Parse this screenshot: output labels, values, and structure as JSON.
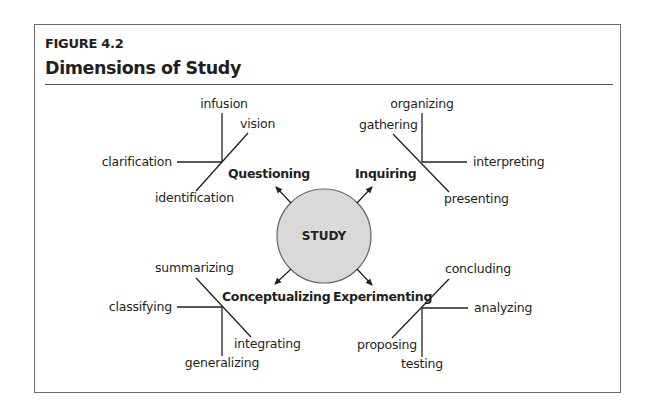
{
  "figure": {
    "label": "FIGURE 4.2",
    "title": "Dimensions of Study"
  },
  "center": {
    "label": "STUDY",
    "fill": "#d9d9d9",
    "stroke": "#666666"
  },
  "dimensions": [
    {
      "name": "Questioning",
      "position": "top-left",
      "branches": [
        "infusion",
        "vision",
        "clarification",
        "identification"
      ]
    },
    {
      "name": "Inquiring",
      "position": "top-right",
      "branches": [
        "organizing",
        "gathering",
        "interpreting",
        "presenting"
      ]
    },
    {
      "name": "Conceptualizing",
      "position": "bottom-left",
      "branches": [
        "summarizing",
        "classifying",
        "integrating",
        "generalizing"
      ]
    },
    {
      "name": "Experimenting",
      "position": "bottom-right",
      "branches": [
        "concluding",
        "analyzing",
        "proposing",
        "testing"
      ]
    }
  ]
}
